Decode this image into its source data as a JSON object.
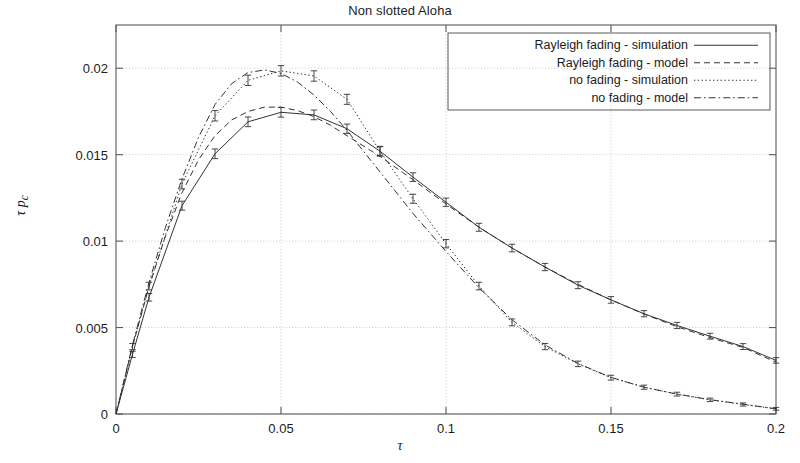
{
  "chart_data": {
    "type": "line",
    "title": "Non slotted Aloha",
    "xlabel": "τ",
    "ylabel": "τ p",
    "ylabel_sub": "c",
    "xlim": [
      0,
      0.2
    ],
    "ylim": [
      0,
      0.0225
    ],
    "grid": true,
    "legend_position": "top-right",
    "xticks": [
      0,
      0.05,
      0.1,
      0.15,
      0.2
    ],
    "xtick_labels": [
      "0",
      "0.05",
      "0.1",
      "0.15",
      "0.2"
    ],
    "yticks": [
      0,
      0.005,
      0.01,
      0.015,
      0.02
    ],
    "ytick_labels": [
      "0",
      "0.005",
      "0.01",
      "0.015",
      "0.02"
    ],
    "series": [
      {
        "name": "Rayleigh fading - simulation",
        "style": "solid",
        "has_error_bars": true,
        "x": [
          0,
          0.005,
          0.01,
          0.02,
          0.03,
          0.04,
          0.05,
          0.06,
          0.07,
          0.08,
          0.09,
          0.1,
          0.11,
          0.12,
          0.13,
          0.14,
          0.15,
          0.16,
          0.17,
          0.18,
          0.19,
          0.2
        ],
        "y": [
          0,
          0.00345,
          0.00675,
          0.01205,
          0.01505,
          0.0169,
          0.01745,
          0.0173,
          0.0165,
          0.0152,
          0.0137,
          0.01225,
          0.0108,
          0.0096,
          0.0085,
          0.00745,
          0.0066,
          0.0058,
          0.00512,
          0.0045,
          0.0039,
          0.0031
        ],
        "err": [
          0,
          0.00018,
          0.00022,
          0.00026,
          0.00028,
          0.00028,
          0.00028,
          0.00028,
          0.00027,
          0.00026,
          0.00025,
          0.00024,
          0.00023,
          0.00022,
          0.00021,
          0.0002,
          0.00019,
          0.00018,
          0.00018,
          0.00017,
          0.00017,
          0.00016
        ]
      },
      {
        "name": "Rayleigh fading - model",
        "style": "dashed",
        "has_error_bars": false,
        "x": [
          0,
          0.005,
          0.01,
          0.015,
          0.02,
          0.025,
          0.03,
          0.035,
          0.04,
          0.045,
          0.05,
          0.055,
          0.06,
          0.065,
          0.07,
          0.08,
          0.09,
          0.1,
          0.11,
          0.12,
          0.13,
          0.14,
          0.15,
          0.16,
          0.17,
          0.18,
          0.19,
          0.2
        ],
        "y": [
          0,
          0.0039,
          0.00735,
          0.0103,
          0.0128,
          0.0147,
          0.0161,
          0.017,
          0.0175,
          0.01775,
          0.01775,
          0.01755,
          0.0172,
          0.0167,
          0.0161,
          0.0149,
          0.01355,
          0.01215,
          0.0108,
          0.0096,
          0.0085,
          0.0075,
          0.0066,
          0.00578,
          0.00505,
          0.00442,
          0.00385,
          0.003
        ]
      },
      {
        "name": "no fading - simulation",
        "style": "dotted",
        "has_error_bars": true,
        "x": [
          0,
          0.005,
          0.01,
          0.02,
          0.03,
          0.04,
          0.05,
          0.06,
          0.07,
          0.08,
          0.09,
          0.1,
          0.11,
          0.12,
          0.13,
          0.14,
          0.15,
          0.16,
          0.17,
          0.18,
          0.19,
          0.2
        ],
        "y": [
          0,
          0.0039,
          0.0074,
          0.0133,
          0.01725,
          0.0193,
          0.01985,
          0.01955,
          0.0182,
          0.0152,
          0.01245,
          0.00985,
          0.0074,
          0.0053,
          0.0039,
          0.0029,
          0.0021,
          0.00155,
          0.00115,
          0.00082,
          0.00055,
          0.0003
        ],
        "err": [
          0,
          0.00018,
          0.00022,
          0.00028,
          0.0003,
          0.0003,
          0.0003,
          0.0003,
          0.00029,
          0.00028,
          0.00026,
          0.00024,
          0.00022,
          0.0002,
          0.00018,
          0.00016,
          0.00014,
          0.00012,
          0.00011,
          0.0001,
          9e-05,
          8e-05
        ]
      },
      {
        "name": "no fading - model",
        "style": "dashdot",
        "has_error_bars": false,
        "x": [
          0,
          0.005,
          0.01,
          0.015,
          0.02,
          0.025,
          0.03,
          0.035,
          0.04,
          0.045,
          0.05,
          0.055,
          0.06,
          0.065,
          0.07,
          0.075,
          0.08,
          0.09,
          0.1,
          0.11,
          0.12,
          0.13,
          0.14,
          0.15,
          0.16,
          0.17,
          0.18,
          0.19,
          0.2
        ],
        "y": [
          0,
          0.004,
          0.0076,
          0.0108,
          0.0136,
          0.016,
          0.0179,
          0.0191,
          0.01975,
          0.0199,
          0.0197,
          0.0192,
          0.01845,
          0.0175,
          0.0164,
          0.0152,
          0.014,
          0.0116,
          0.0094,
          0.0073,
          0.00545,
          0.004,
          0.00292,
          0.00212,
          0.00155,
          0.00115,
          0.00083,
          0.00057,
          0.0003
        ]
      }
    ]
  },
  "style": {
    "frame_color": "#5a5a5a",
    "grid_color": "#c8c8c8",
    "line_color": "#333333",
    "background": "#ffffff"
  }
}
